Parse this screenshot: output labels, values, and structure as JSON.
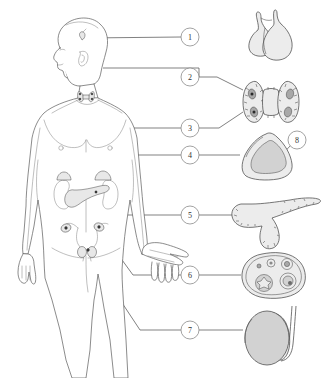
{
  "figure": {
    "background_color": "#ffffff",
    "width": 324,
    "height": 378,
    "line_color": "#4a4a4a",
    "circle_fill": "#ffffff",
    "circle_stroke": "#8a8a8a"
  },
  "body": {
    "name": "human-body-anterior-view",
    "description": "Outline drawing of a standing human figure, head turned in profile to the left, arms at sides, shown from chest to thighs",
    "outline_color": "#5a5a5a",
    "fill_color": "#ffffff"
  },
  "callouts": [
    {
      "number": "1",
      "organ": "pituitary-gland",
      "circle": {
        "cx": 190,
        "cy": 37
      },
      "body_marker": {
        "x": 85,
        "y": 38
      },
      "illustration": {
        "cx": 272,
        "cy": 37
      }
    },
    {
      "number": "2",
      "organ": "thyroid-gland",
      "circle": {
        "cx": 190,
        "cy": 77
      },
      "body_marker": {
        "x": 103,
        "y": 68
      },
      "illustration": {
        "cx": 270,
        "cy": 100
      }
    },
    {
      "number": "3",
      "organ": "parathyroid-glands",
      "circle": {
        "cx": 190,
        "cy": 128
      },
      "body_marker": {
        "x": 85,
        "y": 96
      },
      "illustration": {
        "cx": 270,
        "cy": 100
      }
    },
    {
      "number": "4",
      "organ": "adrenal-gland",
      "circle": {
        "cx": 190,
        "cy": 155
      },
      "body_marker": {
        "x": 96,
        "y": 172
      },
      "illustration": {
        "cx": 268,
        "cy": 157
      }
    },
    {
      "number": "5",
      "organ": "pancreas",
      "circle": {
        "cx": 190,
        "cy": 215
      },
      "body_marker": {
        "x": 96,
        "y": 192
      },
      "illustration": {
        "cx": 272,
        "cy": 221
      }
    },
    {
      "number": "6",
      "organ": "ovary",
      "circle": {
        "cx": 190,
        "cy": 275
      },
      "body_marker": {
        "x": 97,
        "y": 227
      },
      "illustration": {
        "cx": 273,
        "cy": 276
      }
    },
    {
      "number": "7",
      "organ": "testis",
      "circle": {
        "cx": 190,
        "cy": 330
      },
      "body_marker": {
        "x": 86,
        "y": 250
      },
      "illustration": {
        "cx": 272,
        "cy": 338
      }
    },
    {
      "number": "8",
      "organ": "adrenal-cortex",
      "circle": {
        "cx": 297,
        "cy": 140
      },
      "illustration": {
        "cx": 268,
        "cy": 157
      }
    }
  ],
  "organ_illustrations": [
    {
      "name": "pituitary-gland",
      "label_number": "1",
      "description": "Bulbous gland with a curved stalk (infundibulum) rising from its top, anterior and posterior lobes visible",
      "fill": "#ececec"
    },
    {
      "name": "thyroid-and-parathyroid-glands",
      "label_number": "2 and 3",
      "description": "Butterfly-shaped thyroid with two lateral lobes joined by an isthmus; four small dark oval parathyroid glands embedded on the posterior surface",
      "fill": "#ececec",
      "parathyroid_fill": "#9a9a9a"
    },
    {
      "name": "adrenal-gland-cross-section",
      "label_number": "4",
      "description": "Triangular adrenal gland cut in cross section showing a pale outer cortex and a darker inner medulla",
      "cortex_fill": "#ececec",
      "medulla_fill": "#a8a8a8"
    },
    {
      "name": "pancreas",
      "label_number": "5",
      "description": "Elongated tadpole-shaped pancreas with a bulbous head, tapering body and tail, stippled lobulated surface",
      "fill": "#ececec"
    },
    {
      "name": "ovary-cross-section",
      "label_number": "6",
      "description": "Oval ovary in cross section showing primordial, primary, secondary and mature Graafian follicles plus a corpus luteum",
      "fill": "#ececec"
    },
    {
      "name": "testis",
      "label_number": "7",
      "description": "Oval testis with epididymis curving over its upper and posterior border and the vas deferens ascending",
      "fill": "#d2d2d2"
    }
  ],
  "body_organ_markers": [
    {
      "name": "pituitary-in-head",
      "description": "Small gland marked at the base of the brain"
    },
    {
      "name": "thyroid-in-neck",
      "description": "Butterfly shape at the front of the neck over the trachea"
    },
    {
      "name": "adrenal-glands-on-kidneys",
      "description": "Caps sitting on the superior pole of each kidney"
    },
    {
      "name": "kidneys",
      "description": "Paired bean-shaped organs in the posterior abdomen"
    },
    {
      "name": "pancreas-in-abdomen",
      "description": "Shaded organ behind the stomach between the kidneys"
    },
    {
      "name": "uterus-and-ovaries",
      "description": "Uterus with fallopian tubes and an ovary at each side in the pelvis"
    }
  ]
}
